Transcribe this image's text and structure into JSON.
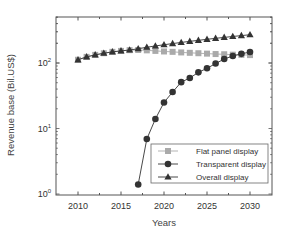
{
  "chart_data": {
    "type": "line",
    "title": "",
    "xlabel": "Years",
    "ylabel": "Revenue base (Bil.US$)",
    "yscale": "log",
    "xlim": [
      2007.5,
      2032.5
    ],
    "ylim": [
      1,
      500
    ],
    "xticks": [
      2010,
      2015,
      2020,
      2025,
      2030
    ],
    "xtick_labels": [
      "2010",
      "2015",
      "2020",
      "2025",
      "2030"
    ],
    "yticks": [
      1,
      10,
      100
    ],
    "ytick_labels": [
      {
        "base": "10",
        "exp": "0"
      },
      {
        "base": "10",
        "exp": "1"
      },
      {
        "base": "10",
        "exp": "2"
      }
    ],
    "grid": false,
    "legend_position": "lower right",
    "series": [
      {
        "name": "Flat panel display",
        "marker": "square",
        "color": "#aaaaaa",
        "x": [
          2010,
          2011,
          2012,
          2013,
          2014,
          2015,
          2016,
          2017,
          2018,
          2019,
          2020,
          2021,
          2022,
          2023,
          2024,
          2025,
          2026,
          2027,
          2028,
          2029,
          2030
        ],
        "values": [
          112,
          124,
          133,
          141,
          148,
          153,
          157,
          158,
          156,
          153,
          150,
          148,
          145,
          143,
          141,
          139,
          137,
          136,
          134,
          133,
          132
        ]
      },
      {
        "name": "Transparent display",
        "marker": "circle",
        "color": "#333333",
        "x": [
          2017,
          2018,
          2019,
          2020,
          2021,
          2022,
          2023,
          2024,
          2025,
          2026,
          2027,
          2028,
          2029,
          2030
        ],
        "values": [
          1.4,
          6.9,
          14,
          25,
          36,
          51,
          59,
          72,
          83,
          98,
          115,
          128,
          138,
          147
        ]
      },
      {
        "name": "Overall display",
        "marker": "triangle",
        "color": "#333333",
        "x": [
          2010,
          2011,
          2012,
          2013,
          2014,
          2015,
          2016,
          2017,
          2018,
          2019,
          2020,
          2021,
          2022,
          2023,
          2024,
          2025,
          2026,
          2027,
          2028,
          2029,
          2030
        ],
        "values": [
          112,
          124,
          133,
          141,
          148,
          153,
          158,
          165,
          174,
          182,
          190,
          198,
          206,
          214,
          222,
          230,
          238,
          246,
          254,
          262,
          270
        ]
      }
    ]
  }
}
